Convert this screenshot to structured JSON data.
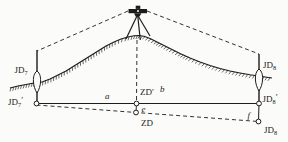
{
  "figure": {
    "description_labels": {
      "jd7": {
        "base": "JD",
        "sub": "7",
        "prime": ""
      },
      "jd7_prime": {
        "base": "JD",
        "sub": "7",
        "prime": "′"
      },
      "zd_prime": {
        "base": "ZD",
        "sub": "",
        "prime": "′"
      },
      "zd": {
        "base": "ZD",
        "sub": "",
        "prime": ""
      },
      "jd8_top": {
        "base": "JD",
        "sub": "8",
        "prime": ""
      },
      "jd8_prime": {
        "base": "JD",
        "sub": "8",
        "prime": "′"
      },
      "jd8_bottom": {
        "base": "JD",
        "sub": "8",
        "prime": ""
      },
      "dist_a": "a",
      "dist_b": "b",
      "offset_e": "e",
      "offset_f": "f"
    },
    "colors": {
      "ink": "#1c1c1c",
      "paper": "#fbfbf9"
    }
  }
}
